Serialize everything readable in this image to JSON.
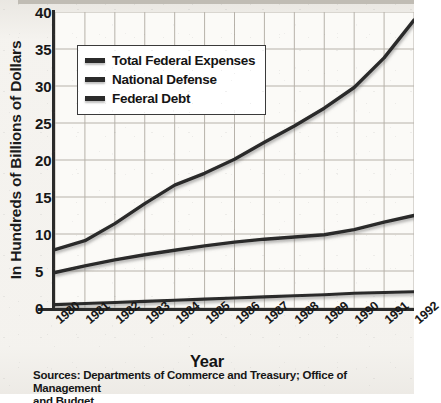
{
  "chart_data": {
    "type": "line",
    "title": "",
    "xlabel": "Year",
    "ylabel": "In Hundreds of Billions of Dollars",
    "categories": [
      "1980",
      "1981",
      "1982",
      "1983",
      "1984",
      "1985",
      "1986",
      "1987",
      "1988",
      "1989",
      "1990",
      "1991",
      "1992"
    ],
    "x": [
      1980,
      1981,
      1982,
      1983,
      1984,
      1985,
      1986,
      1987,
      1988,
      1989,
      1990,
      1991,
      1992
    ],
    "xlim": [
      1980,
      1992
    ],
    "ylim": [
      0,
      40
    ],
    "yticks": [
      0,
      5,
      10,
      15,
      20,
      25,
      30,
      35,
      40
    ],
    "grid": true,
    "legend_position": "upper-left-inside",
    "series": [
      {
        "name": "Total Federal Expenses",
        "values": [
          7.9,
          9.1,
          11.4,
          14.1,
          16.6,
          18.2,
          20.1,
          22.4,
          24.6,
          27.0,
          29.8,
          33.8,
          38.9
        ]
      },
      {
        "name": "National Defense",
        "values": [
          4.8,
          5.7,
          6.5,
          7.2,
          7.8,
          8.4,
          8.9,
          9.3,
          9.6,
          9.9,
          10.6,
          11.6,
          12.5
        ]
      },
      {
        "name": "Federal Debt",
        "values": [
          0.45,
          0.6,
          0.75,
          0.9,
          1.05,
          1.2,
          1.35,
          1.5,
          1.65,
          1.8,
          2.0,
          2.1,
          2.2
        ]
      }
    ]
  },
  "axis": {
    "y_title": "In Hundreds of Billions of Dollars",
    "x_title": "Year",
    "y_tick_labels": [
      "40",
      "35",
      "30",
      "25",
      "20",
      "15",
      "10",
      "5",
      "0"
    ],
    "x_tick_labels": [
      "1980",
      "1981",
      "1982",
      "1983",
      "1984",
      "1985",
      "1986",
      "1987",
      "1988",
      "1989",
      "1990",
      "1991",
      "1992"
    ]
  },
  "legend": {
    "items": [
      {
        "label": "Total Federal Expenses",
        "color": "#2b2b2b"
      },
      {
        "label": "National Defense",
        "color": "#2b2b2b"
      },
      {
        "label": "Federal Debt",
        "color": "#2b2b2b"
      }
    ]
  },
  "source": {
    "line1": "Sources: Departments of Commerce and Treasury; Office of Management",
    "line2": "and Budget"
  },
  "colors": {
    "line": "#2b2b2b",
    "grid": "#b7b2aa",
    "axis": "#2a2a2a",
    "paper": "#f4f2ee"
  }
}
